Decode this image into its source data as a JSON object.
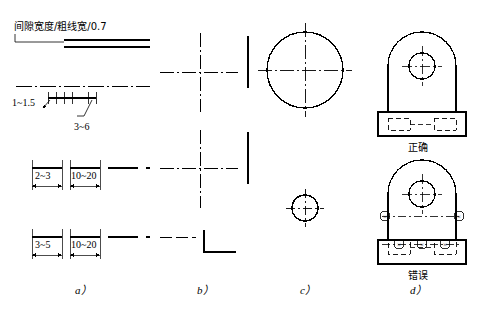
{
  "figure": {
    "title_note": "间隙宽度/粗线宽/0.7",
    "captions": [
      {
        "id": "a",
        "text": "a）",
        "x": 75,
        "y": 290
      },
      {
        "id": "b",
        "text": "b）",
        "x": 197,
        "y": 290
      },
      {
        "id": "c",
        "text": "c）",
        "x": 305,
        "y": 290
      },
      {
        "id": "d",
        "text": "d）",
        "x": 412,
        "y": 290
      }
    ],
    "panel_a": {
      "note": "间隙宽度/粗线宽/0.7",
      "dimensions": [
        {
          "text": "1~1.5",
          "x": 16,
          "y": 103
        },
        {
          "text": "3~6",
          "x": 78,
          "y": 128
        },
        {
          "text": "2~3",
          "x": 39,
          "y": 177
        },
        {
          "text": "10~20",
          "x": 76,
          "y": 177
        },
        {
          "text": "3~5",
          "x": 39,
          "y": 246
        },
        {
          "text": "10~20",
          "x": 76,
          "y": 246
        }
      ]
    },
    "panel_d": {
      "labels": [
        {
          "text": "正确",
          "x": 408,
          "y": 148
        },
        {
          "text": "错误",
          "x": 408,
          "y": 276
        }
      ],
      "error_marks": [
        "×",
        "×",
        "×",
        "×",
        "×"
      ]
    },
    "colors": {
      "line": "#000000",
      "background": "#ffffff"
    }
  }
}
